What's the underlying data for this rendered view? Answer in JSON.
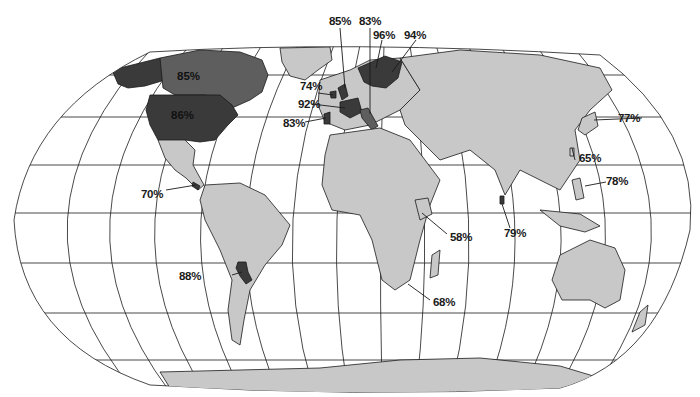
{
  "map": {
    "projection": "world-oval",
    "colors": {
      "background": "#ffffff",
      "land": "#c8c8c8",
      "highlight_dark": "#3a3a3a",
      "highlight_mid": "#5e5e5e",
      "lines": "#1a1a1a"
    },
    "labels": [
      {
        "id": "canada",
        "text": "85%"
      },
      {
        "id": "usa",
        "text": "86%"
      },
      {
        "id": "central-america",
        "text": "70%"
      },
      {
        "id": "paraguay",
        "text": "88%"
      },
      {
        "id": "ireland",
        "text": "74%"
      },
      {
        "id": "uk",
        "text": "85%"
      },
      {
        "id": "france",
        "text": "92%"
      },
      {
        "id": "portugal",
        "text": "83%"
      },
      {
        "id": "switzerland-italy",
        "text": "83%"
      },
      {
        "id": "sweden",
        "text": "96%"
      },
      {
        "id": "finland",
        "text": "94%"
      },
      {
        "id": "japan",
        "text": "77%"
      },
      {
        "id": "taiwan",
        "text": "65%"
      },
      {
        "id": "philippines",
        "text": "78%"
      },
      {
        "id": "sri-lanka",
        "text": "79%"
      },
      {
        "id": "kenya",
        "text": "58%"
      },
      {
        "id": "south-africa",
        "text": "68%"
      }
    ]
  }
}
